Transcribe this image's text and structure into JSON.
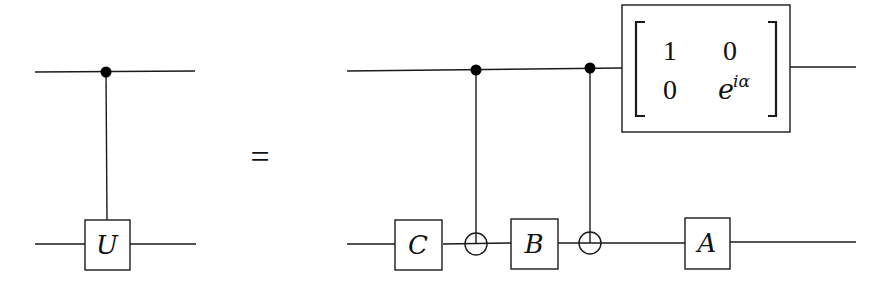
{
  "diagram": {
    "type": "quantum-circuit-identity",
    "line_color": "#1a1a1a",
    "background": "#ffffff",
    "equals_sign": "=",
    "left_circuit": {
      "wires": [
        "control",
        "target"
      ],
      "gates": [
        {
          "type": "controlled",
          "control_wire": 0,
          "target_wire": 1,
          "label": "U"
        }
      ]
    },
    "right_circuit": {
      "wires": [
        "control",
        "target"
      ],
      "gates": [
        {
          "type": "single",
          "wire": 1,
          "label": "C"
        },
        {
          "type": "cnot",
          "control_wire": 0,
          "target_wire": 1
        },
        {
          "type": "single",
          "wire": 1,
          "label": "B"
        },
        {
          "type": "cnot",
          "control_wire": 0,
          "target_wire": 1
        },
        {
          "type": "single",
          "wire": 1,
          "label": "A"
        },
        {
          "type": "matrix",
          "wire": 0,
          "matrix": [
            [
              "1",
              "0"
            ],
            [
              "0",
              "e^{iα}"
            ]
          ]
        }
      ]
    },
    "labels": {
      "U": "U",
      "C": "C",
      "B": "B",
      "A": "A",
      "m11": "1",
      "m12": "0",
      "m21": "0",
      "m22_base": "e",
      "m22_exp": "iα"
    }
  }
}
